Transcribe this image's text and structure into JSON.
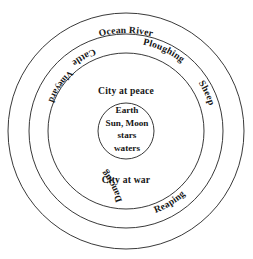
{
  "diagram": {
    "background_color": "#ffffff",
    "stroke_color": "#222222",
    "center": {
      "cx": 126,
      "cy": 131
    },
    "rings": [
      {
        "name": "ocean-ring",
        "r": 118,
        "label": "Ocean River"
      },
      {
        "name": "outer-ring",
        "r": 97,
        "label": ""
      },
      {
        "name": "middle-ring",
        "r": 78,
        "label": ""
      },
      {
        "name": "inner-circle",
        "r": 28,
        "label": ""
      }
    ],
    "labels": {
      "ocean_river": "Ocean River",
      "ploughing": "Ploughing",
      "cattle": "Cattle",
      "vineyard": "Vineyard",
      "sheep": "Sheep",
      "reaping": "Reaping",
      "dancing": "Dancing",
      "city_at_peace": "City at peace",
      "city_at_war": "City at war"
    },
    "center_lines": [
      "Earth",
      "Sun, Moon",
      "stars",
      "waters"
    ]
  }
}
